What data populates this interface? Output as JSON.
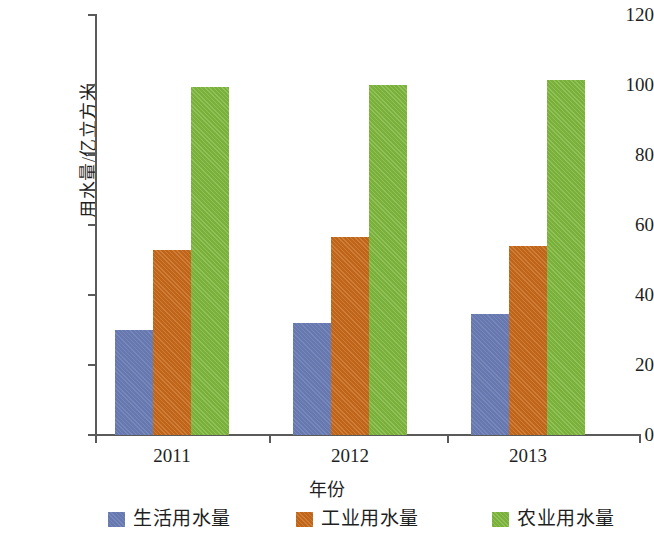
{
  "chart_data": {
    "type": "bar",
    "title": "",
    "xlabel": "年份",
    "ylabel": "用水量/亿立方米",
    "categories": [
      "2011",
      "2012",
      "2013"
    ],
    "series": [
      {
        "name": "生活用水量",
        "color": "#6a7cb5",
        "values": [
          30,
          32,
          34.5
        ]
      },
      {
        "name": "工业用水量",
        "color": "#c86a1a",
        "values": [
          53,
          56.5,
          54
        ]
      },
      {
        "name": "农业用水量",
        "color": "#80b93e",
        "values": [
          99.5,
          100,
          101.5
        ]
      }
    ],
    "ylim": [
      0,
      120
    ],
    "y_ticks": [
      "0",
      "20",
      "40",
      "60",
      "80",
      "100",
      "120"
    ],
    "y_tick_values": [
      0,
      20,
      40,
      60,
      80,
      100,
      120
    ],
    "grid": false,
    "legend_position": "bottom"
  },
  "axis": {
    "y_title": "用水量/亿立方米",
    "x_title": "年份"
  },
  "legend": {
    "items": [
      {
        "label": "生活用水量",
        "color": "#6a7cb5"
      },
      {
        "label": "工业用水量",
        "color": "#c86a1a"
      },
      {
        "label": "农业用水量",
        "color": "#80b93e"
      }
    ]
  }
}
